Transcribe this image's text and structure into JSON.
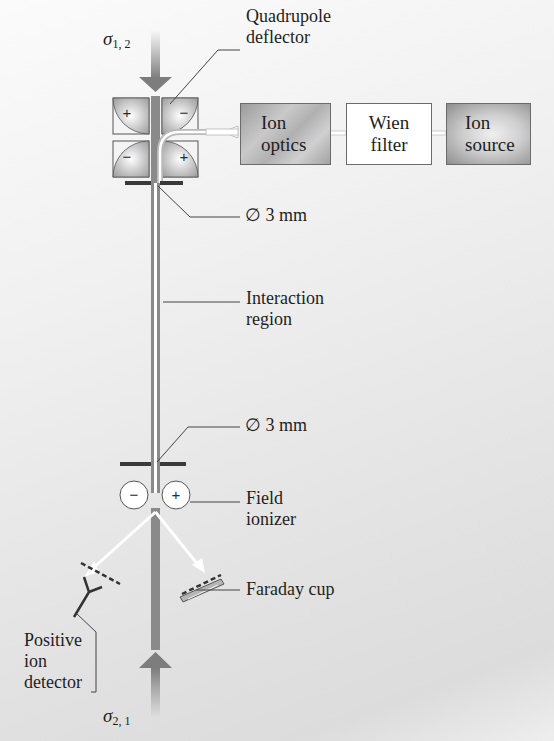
{
  "diagram": {
    "top_beam": {
      "symbol": "σ",
      "subscript": "1, 2"
    },
    "bottom_beam": {
      "symbol": "σ",
      "subscript": "2, 1"
    },
    "labels": {
      "quadrupole_deflector": [
        "Quadrupole",
        "deflector"
      ],
      "aperture_top": "∅ 3 mm",
      "interaction_region": [
        "Interaction",
        "region"
      ],
      "aperture_bottom": "∅ 3 mm",
      "field_ionizer": [
        "Field",
        "ionizer"
      ],
      "faraday_cup": "Faraday cup",
      "positive_ion_detector": [
        "Positive",
        "ion",
        "detector"
      ]
    },
    "boxes": [
      {
        "id": "ion-optics",
        "lines": [
          "Ion",
          "optics"
        ]
      },
      {
        "id": "wien-filter",
        "lines": [
          "Wien",
          "filter"
        ]
      },
      {
        "id": "ion-source",
        "lines": [
          "Ion",
          "source"
        ]
      }
    ],
    "quadrupole_signs": {
      "top_left": "+",
      "top_right": "−",
      "bottom_left": "−",
      "bottom_right": "+"
    },
    "ionizer_signs": {
      "left": "−",
      "right": "+"
    },
    "colors": {
      "beam": "#8a8a8a",
      "electrode_dark": "#333333",
      "arrow_white": "#ffffff"
    }
  }
}
